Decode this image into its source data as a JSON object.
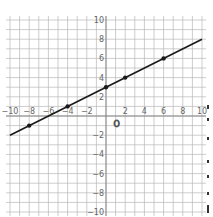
{
  "chart_data": {
    "type": "line",
    "title": "",
    "xlabel": "",
    "ylabel": "",
    "xlim": [
      -10,
      10
    ],
    "ylim": [
      -10,
      10
    ],
    "grid": true,
    "x_ticks": [
      -10,
      -8,
      -6,
      -4,
      -2,
      2,
      4,
      6,
      8,
      10
    ],
    "y_ticks": [
      10,
      8,
      6,
      4,
      2,
      -2,
      -4,
      -6,
      -8,
      -10
    ],
    "origin_label": "O",
    "series": [
      {
        "name": "line",
        "equation": "y = 0.5x + 3",
        "slope": 0.5,
        "intercept": 3,
        "x_range": [
          -10,
          10
        ],
        "marked_points": [
          [
            -8,
            -1
          ],
          [
            -4,
            1
          ],
          [
            0,
            3
          ],
          [
            2,
            4
          ],
          [
            6,
            6
          ]
        ]
      }
    ]
  },
  "labels": {
    "origin": "O",
    "x_ticks": [
      "-10",
      "-8",
      "-6",
      "-4",
      "-2",
      "2",
      "4",
      "6",
      "8",
      "10"
    ],
    "y_ticks": [
      "10",
      "8",
      "6",
      "4",
      "2",
      "-2",
      "-4",
      "-6",
      "-8",
      "-10"
    ]
  },
  "colors": {
    "grid": "#b8b8b8",
    "axis": "#888888",
    "line": "#1a1a1a",
    "points": "#1a1a1a",
    "tick_text": "#666666"
  }
}
